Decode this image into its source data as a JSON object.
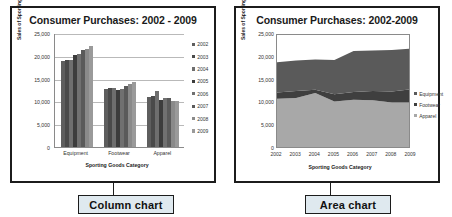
{
  "figure": {
    "background": "#ffffff",
    "callouts": [
      {
        "label": "Column chart"
      },
      {
        "label": "Area chart"
      }
    ]
  },
  "colors": {
    "equipment": "#5a5a5a",
    "footwear": "#3f3f3f",
    "apparel": "#a8a8a8",
    "panel_border": "#1c1c1c",
    "callout_fill": "#dfe9ef",
    "gridline": "#b9b9b9"
  },
  "chart_data": [
    {
      "type": "bar",
      "title": "Consumer Purchases: 2002 - 2009",
      "xlabel": "Sporting Goods Category",
      "ylabel": "Sales of Sporting Goods  in Millions",
      "categories": [
        "Equipment",
        "Footwear",
        "Apparel"
      ],
      "ylim": [
        0,
        25000
      ],
      "yticks": [
        0,
        5000,
        10000,
        15000,
        20000,
        25000
      ],
      "ytick_labels": [
        "0",
        "5,000",
        "10,000",
        "15,000",
        "20,000",
        "25,000"
      ],
      "grid": true,
      "legend_position": "right",
      "series": [
        {
          "name": "2002",
          "values": [
            18900,
            12800,
            11000
          ]
        },
        {
          "name": "2003",
          "values": [
            19000,
            13000,
            11200
          ]
        },
        {
          "name": "2004",
          "values": [
            19100,
            12900,
            12300
          ]
        },
        {
          "name": "2005",
          "values": [
            20200,
            12500,
            10400
          ]
        },
        {
          "name": "2006",
          "values": [
            20400,
            12700,
            10800
          ]
        },
        {
          "name": "2007",
          "values": [
            21300,
            13300,
            10700
          ]
        },
        {
          "name": "2008",
          "values": [
            21500,
            13900,
            10200
          ]
        },
        {
          "name": "2009",
          "values": [
            22100,
            14200,
            10200
          ]
        }
      ]
    },
    {
      "type": "area",
      "title": "Consumer Purchases: 2002-2009",
      "xlabel": "Sporting Goods Category",
      "ylabel": "Sales of Sporting Goods  in Millions",
      "x": [
        "2002",
        "2003",
        "2004",
        "2005",
        "2006",
        "2007",
        "2008",
        "2009"
      ],
      "ylim": [
        0,
        25000
      ],
      "yticks": [
        0,
        5000,
        10000,
        15000,
        20000,
        25000
      ],
      "ytick_labels": [
        "0",
        "5,000",
        "10,000",
        "15,000",
        "20,000",
        "25,000"
      ],
      "stacked": true,
      "grid": false,
      "legend_position": "right",
      "series": [
        {
          "name": "Apparel",
          "values": [
            11000,
            11200,
            12300,
            10400,
            10800,
            10700,
            10200,
            10200
          ]
        },
        {
          "name": "Footwear",
          "values": [
            1400,
            1500,
            700,
            1600,
            1700,
            2000,
            2400,
            2900
          ]
        },
        {
          "name": "Equipment",
          "values": [
            6600,
            6700,
            6600,
            7500,
            9000,
            8900,
            9100,
            8900
          ]
        }
      ]
    }
  ]
}
